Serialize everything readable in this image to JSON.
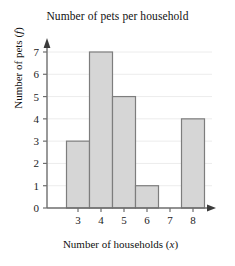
{
  "chart_data": {
    "type": "bar",
    "title": "Number of pets per household",
    "xlabel": "Number of households (x)",
    "xlabel_text": "Number of households",
    "xlabel_var": "x",
    "ylabel": "Number of pets (f)",
    "ylabel_text": "Number of pets",
    "ylabel_var": "f",
    "categories": [
      "3",
      "4",
      "5",
      "6",
      "7",
      "8"
    ],
    "values": [
      3,
      7,
      5,
      1,
      0,
      4
    ],
    "xticks": [
      "3",
      "4",
      "5",
      "6",
      "7",
      "8"
    ],
    "yticks": [
      "0",
      "1",
      "2",
      "3",
      "4",
      "5",
      "6",
      "7"
    ],
    "ylim": [
      0,
      7.6
    ],
    "xlim": [
      2.5,
      8.9
    ],
    "grid": true,
    "grid_axis": "y",
    "legend": "none",
    "bar_fill": "#d6d6d6",
    "bar_border": "#7d7d7d",
    "axis_color": "#6e6e6e",
    "grid_color": "#ececec",
    "background": "#ffffff",
    "arrow_heads": [
      "x-right",
      "y-top"
    ]
  }
}
